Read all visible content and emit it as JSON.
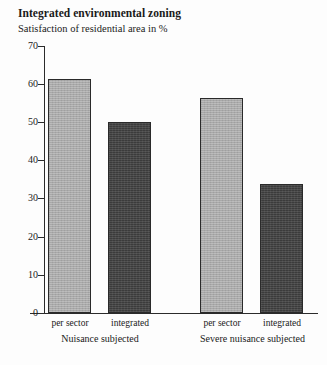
{
  "header": {
    "title": "Integrated environmental zoning",
    "subtitle": "Satisfaction of residential area in %"
  },
  "chart_data": {
    "type": "bar",
    "title": "Integrated environmental zoning",
    "subtitle": "Satisfaction of residential area in %",
    "xlabel": "",
    "ylabel": "",
    "ylim": [
      0,
      70
    ],
    "yticks": [
      0,
      10,
      20,
      30,
      40,
      50,
      60,
      70
    ],
    "ytick_labels": [
      "0",
      "10",
      "20",
      "30",
      "40",
      "50",
      "60",
      "70"
    ],
    "grid": false,
    "legend": "none",
    "categories": [
      "per sector",
      "integrated",
      "per sector",
      "integrated"
    ],
    "groups": [
      {
        "label": "Nuisance subjected",
        "bars": [
          {
            "category": "per sector",
            "value": 61.3,
            "color": "#a9a9a9"
          },
          {
            "category": "integrated",
            "value": 50.2,
            "color": "#3b3b3b"
          }
        ]
      },
      {
        "label": "Severe nuisance subjected",
        "bars": [
          {
            "category": "per sector",
            "value": 56.3,
            "color": "#a9a9a9"
          },
          {
            "category": "integrated",
            "value": 33.8,
            "color": "#3b3b3b"
          }
        ]
      }
    ],
    "values": [
      61.3,
      50.2,
      56.3,
      33.8
    ],
    "colors": {
      "light_bar": "#a9a9a9",
      "dark_bar": "#3b3b3b",
      "axis": "#2b2b2b",
      "text": "#1a1a1a",
      "background": "#fdfdfd"
    }
  }
}
